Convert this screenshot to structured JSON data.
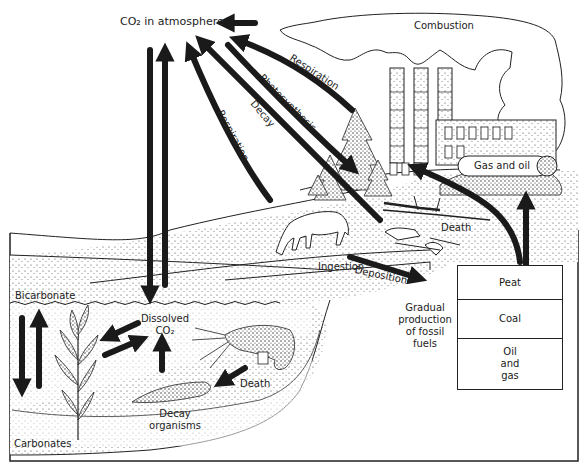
{
  "diagram": {
    "colors": {
      "ink": "#1a1a1a",
      "stipple": "#555555",
      "background": "#ffffff"
    },
    "labels": {
      "co2_atmosphere": "CO₂ in atmosphere",
      "combustion": "Combustion",
      "respiration_plants": "Respiration",
      "photosynthesis": "Photosynthesis",
      "decay": "Decay",
      "respiration_animals": "Respiration",
      "gas_and_oil": "Gas and oil",
      "death_land": "Death",
      "ingestion": "Ingestion",
      "deposition": "Deposition",
      "gradual_production": [
        "Gradual",
        "production",
        "of fossil",
        "fuels"
      ],
      "bicarbonate": "Bicarbonate",
      "dissolved_co2": [
        "Dissolved",
        "CO₂"
      ],
      "death_water": "Death",
      "decay_organisms": [
        "Decay",
        "organisms"
      ],
      "carbonates": "Carbonates"
    },
    "fossil_fuel_layers": [
      {
        "label": "Peat"
      },
      {
        "label": "Coal"
      },
      {
        "label": "Oil\nand\ngas"
      }
    ],
    "icons": [
      "factory-icon",
      "smoke-cloud-icon",
      "tree-icon",
      "horse-icon",
      "skeleton-icon",
      "fallen-tree-icon",
      "seaweed-icon",
      "crayfish-icon",
      "oil-tank-icon"
    ]
  }
}
